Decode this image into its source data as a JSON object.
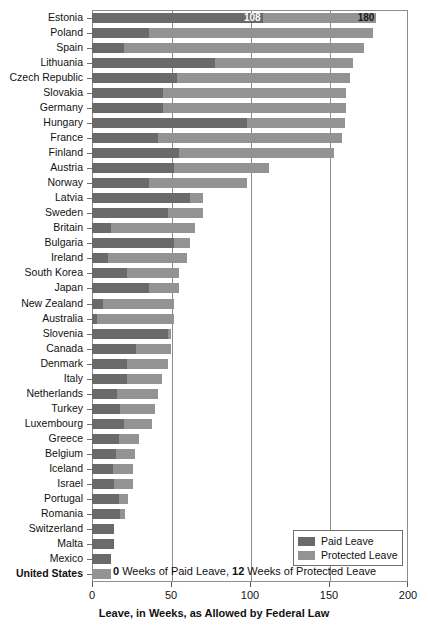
{
  "chart_data": {
    "type": "bar",
    "orientation": "horizontal",
    "stacked": true,
    "title": "",
    "xlabel": "Leave, in Weeks, as Allowed by Federal Law",
    "ylabel": "",
    "xlim": [
      0,
      200
    ],
    "xticks": [
      0,
      50,
      100,
      150,
      200
    ],
    "xticklabels": [
      "0",
      "50",
      "100",
      "150",
      "200"
    ],
    "grid": "vertical",
    "legend_position": "bottom-right",
    "legend": [
      "Paid Leave",
      "Protected Leave"
    ],
    "series": [
      {
        "name": "Paid Leave",
        "color": "#6a6a6a"
      },
      {
        "name": "Protected Leave",
        "color": "#939393"
      }
    ],
    "categories": [
      "Estonia",
      "Poland",
      "Spain",
      "Lithuania",
      "Czech Republic",
      "Slovakia",
      "Germany",
      "Hungary",
      "France",
      "Finland",
      "Austria",
      "Norway",
      "Latvia",
      "Sweden",
      "Britain",
      "Bulgaria",
      "Ireland",
      "South Korea",
      "Japan",
      "New Zealand",
      "Australia",
      "Slovenia",
      "Canada",
      "Denmark",
      "Italy",
      "Netherlands",
      "Turkey",
      "Luxembourg",
      "Greece",
      "Belgium",
      "Iceland",
      "Israel",
      "Portugal",
      "Romania",
      "Switzerland",
      "Malta",
      "Mexico",
      "United States"
    ],
    "rows": [
      {
        "country": "Estonia",
        "paid": 108,
        "total": 180,
        "label_paid": "108",
        "label_total": "180",
        "emphasis": false
      },
      {
        "country": "Poland",
        "paid": 36,
        "total": 178,
        "emphasis": false
      },
      {
        "country": "Spain",
        "paid": 20,
        "total": 172,
        "emphasis": false
      },
      {
        "country": "Lithuania",
        "paid": 78,
        "total": 165,
        "emphasis": false
      },
      {
        "country": "Czech Republic",
        "paid": 54,
        "total": 163,
        "emphasis": false
      },
      {
        "country": "Slovakia",
        "paid": 45,
        "total": 161,
        "emphasis": false
      },
      {
        "country": "Germany",
        "paid": 45,
        "total": 161,
        "emphasis": false
      },
      {
        "country": "Hungary",
        "paid": 98,
        "total": 160,
        "emphasis": false
      },
      {
        "country": "France",
        "paid": 42,
        "total": 158,
        "emphasis": false
      },
      {
        "country": "Finland",
        "paid": 55,
        "total": 153,
        "emphasis": false
      },
      {
        "country": "Austria",
        "paid": 52,
        "total": 112,
        "emphasis": false
      },
      {
        "country": "Norway",
        "paid": 36,
        "total": 98,
        "emphasis": false
      },
      {
        "country": "Latvia",
        "paid": 62,
        "total": 70,
        "emphasis": false
      },
      {
        "country": "Sweden",
        "paid": 48,
        "total": 70,
        "emphasis": false
      },
      {
        "country": "Britain",
        "paid": 12,
        "total": 65,
        "emphasis": false
      },
      {
        "country": "Bulgaria",
        "paid": 52,
        "total": 62,
        "emphasis": false
      },
      {
        "country": "Ireland",
        "paid": 10,
        "total": 60,
        "emphasis": false
      },
      {
        "country": "South Korea",
        "paid": 22,
        "total": 55,
        "emphasis": false
      },
      {
        "country": "Japan",
        "paid": 36,
        "total": 55,
        "emphasis": false
      },
      {
        "country": "New Zealand",
        "paid": 7,
        "total": 52,
        "emphasis": false
      },
      {
        "country": "Australia",
        "paid": 3,
        "total": 52,
        "emphasis": false
      },
      {
        "country": "Slovenia",
        "paid": 48,
        "total": 50,
        "emphasis": false
      },
      {
        "country": "Canada",
        "paid": 28,
        "total": 50,
        "emphasis": false
      },
      {
        "country": "Denmark",
        "paid": 22,
        "total": 48,
        "emphasis": false
      },
      {
        "country": "Italy",
        "paid": 22,
        "total": 44,
        "emphasis": false
      },
      {
        "country": "Netherlands",
        "paid": 16,
        "total": 42,
        "emphasis": false
      },
      {
        "country": "Turkey",
        "paid": 18,
        "total": 40,
        "emphasis": false
      },
      {
        "country": "Luxembourg",
        "paid": 20,
        "total": 38,
        "emphasis": false
      },
      {
        "country": "Greece",
        "paid": 17,
        "total": 30,
        "emphasis": false
      },
      {
        "country": "Belgium",
        "paid": 15,
        "total": 27,
        "emphasis": false
      },
      {
        "country": "Iceland",
        "paid": 13,
        "total": 26,
        "emphasis": false
      },
      {
        "country": "Israel",
        "paid": 14,
        "total": 26,
        "emphasis": false
      },
      {
        "country": "Portugal",
        "paid": 17,
        "total": 23,
        "emphasis": false
      },
      {
        "country": "Romania",
        "paid": 18,
        "total": 21,
        "emphasis": false
      },
      {
        "country": "Switzerland",
        "paid": 14,
        "total": 14,
        "emphasis": false
      },
      {
        "country": "Malta",
        "paid": 14,
        "total": 14,
        "emphasis": false
      },
      {
        "country": "Mexico",
        "paid": 12,
        "total": 12,
        "emphasis": false
      },
      {
        "country": "United States",
        "paid": 0,
        "total": 12,
        "emphasis": true
      }
    ]
  },
  "annotation": {
    "us_note_prefix_value": "0",
    "us_note_mid": " Weeks of Paid Leave, ",
    "us_note_second_value": "12",
    "us_note_suffix": " Weeks of Protected Leave"
  },
  "legend": {
    "paid_label": "Paid Leave",
    "protected_label": "Protected Leave",
    "paid_color": "#6a6a6a",
    "protected_color": "#939393"
  },
  "axis": {
    "title": "Leave, in Weeks, as Allowed by Federal Law",
    "ticks": [
      "0",
      "50",
      "100",
      "150",
      "200"
    ]
  },
  "top_bar_labels": {
    "paid_value": "108",
    "total_value": "180"
  }
}
